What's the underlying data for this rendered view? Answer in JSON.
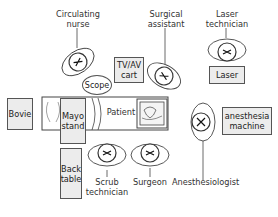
{
  "diagram": {
    "people": [
      {
        "id": "circulating-nurse",
        "label_lines": [
          "Circulating",
          "nurse"
        ]
      },
      {
        "id": "surgical-assistant",
        "label_lines": [
          "Surgical",
          "assistant"
        ]
      },
      {
        "id": "laser-technician",
        "label_lines": [
          "Laser",
          "technician"
        ]
      },
      {
        "id": "scrub-technician",
        "label_lines": [
          "Scrub",
          "technician"
        ]
      },
      {
        "id": "surgeon",
        "label_lines": [
          "Surgeon"
        ]
      },
      {
        "id": "anesthesiologist",
        "label_lines": [
          "Anesthesiologist"
        ]
      }
    ],
    "equipment": [
      {
        "id": "tv-av-cart",
        "label_lines": [
          "TV/AV",
          "cart"
        ]
      },
      {
        "id": "scope",
        "label_lines": [
          "Scope"
        ]
      },
      {
        "id": "laser",
        "label_lines": [
          "Laser"
        ]
      },
      {
        "id": "bovie",
        "label_lines": [
          "Bovie"
        ]
      },
      {
        "id": "mayo-stand",
        "label_lines": [
          "Mayo",
          "stand"
        ]
      },
      {
        "id": "back-table",
        "label_lines": [
          "Back",
          "table"
        ]
      },
      {
        "id": "anesthesia-machine",
        "label_lines": [
          "anesthesia",
          "machine"
        ]
      }
    ],
    "patient_label": "Patient"
  }
}
